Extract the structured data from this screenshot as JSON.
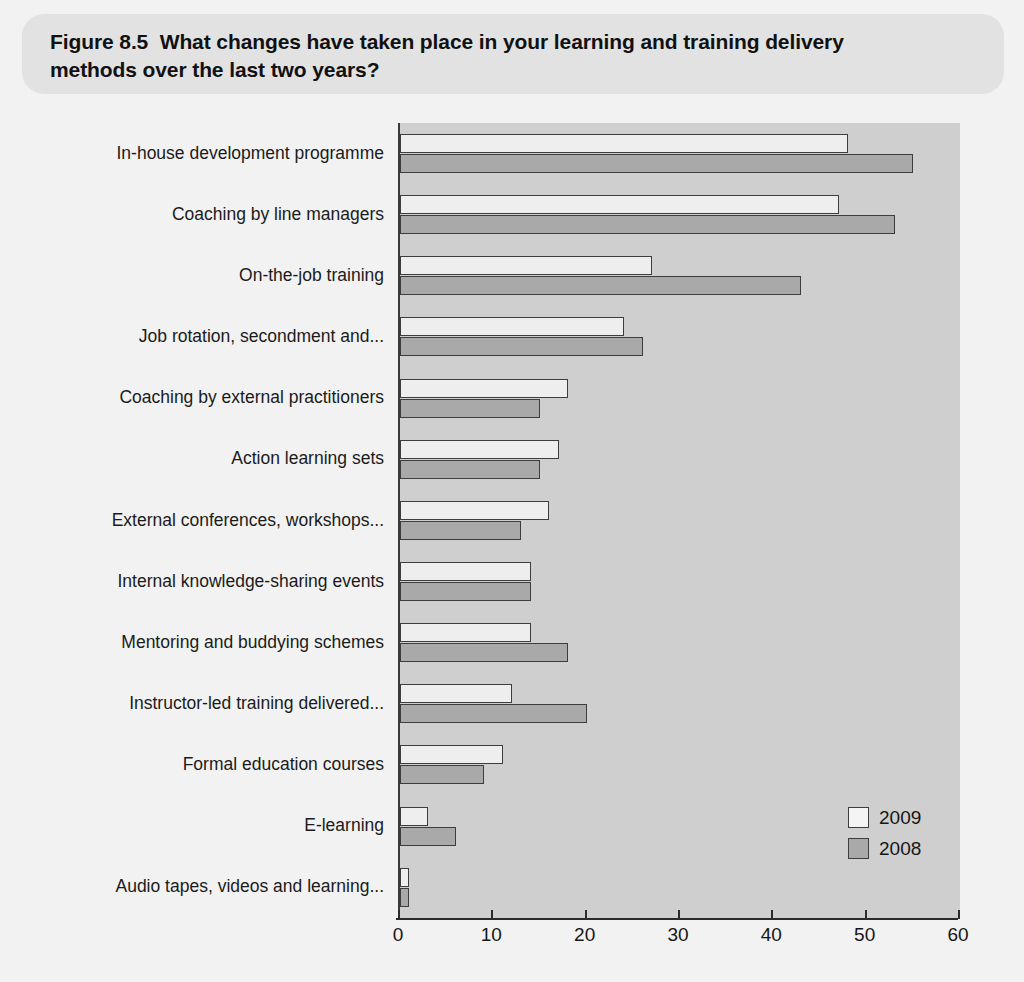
{
  "header": {
    "figure_title": "Figure 8.5  What changes have taken place in your learning and training delivery\nmethods over the last two years?"
  },
  "legend": {
    "items": [
      {
        "label": "2009",
        "color": "#f4f4f4"
      },
      {
        "label": "2008",
        "color": "#a9a9a9"
      }
    ]
  },
  "axis": {
    "tick_labels": [
      "0",
      "10",
      "20",
      "30",
      "40",
      "50",
      "60"
    ]
  },
  "colors": {
    "page_background": "#f2f2f2",
    "header_banner": "#e2e2e2",
    "plot_background": "#cfcfcf",
    "bar_2009": "#eeeeee",
    "bar_2008": "#a9a9a9",
    "bar_outline": "#3d3d3d",
    "axis": "#2b2b2b",
    "text": "#161616"
  },
  "chart_data": {
    "type": "bar",
    "orientation": "horizontal",
    "title": "Figure 8.5  What changes have taken place in your learning and training delivery methods over the last two years?",
    "xlabel": "",
    "ylabel": "",
    "xlim": [
      0,
      60
    ],
    "xticks": [
      0,
      10,
      20,
      30,
      40,
      50,
      60
    ],
    "grid": false,
    "legend_position": "bottom-right",
    "categories": [
      "In-house development programme",
      "Coaching by line managers",
      "On-the-job training",
      "Job rotation, secondment and...",
      "Coaching by external practitioners",
      "Action learning sets",
      "External conferences, workshops...",
      "Internal knowledge-sharing events",
      "Mentoring and buddying schemes",
      "Instructor-led training delivered...",
      "Formal education courses",
      "E-learning",
      "Audio tapes, videos and learning..."
    ],
    "series": [
      {
        "name": "2009",
        "values": [
          48,
          47,
          27,
          24,
          18,
          17,
          16,
          14,
          14,
          12,
          11,
          3,
          1
        ]
      },
      {
        "name": "2008",
        "values": [
          55,
          53,
          43,
          26,
          15,
          15,
          13,
          14,
          18,
          20,
          9,
          6,
          1
        ]
      }
    ]
  }
}
